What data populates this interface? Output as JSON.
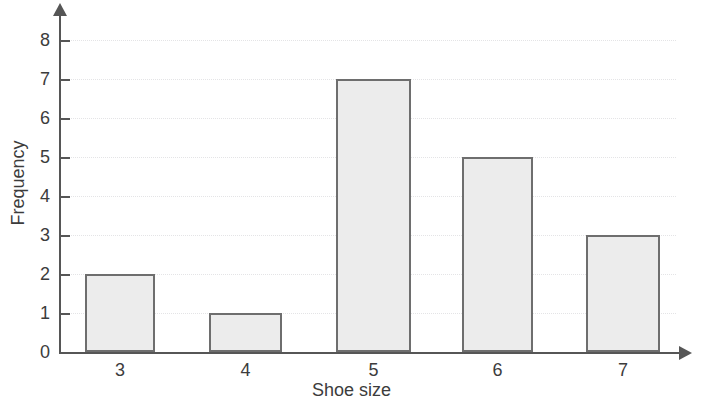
{
  "chart_data": {
    "type": "bar",
    "title": "",
    "xlabel": "Shoe size",
    "ylabel": "Frequency",
    "categories": [
      "3",
      "4",
      "5",
      "6",
      "7"
    ],
    "values": [
      2,
      1,
      7,
      5,
      3
    ],
    "ylim": [
      0,
      8
    ],
    "y_ticks": [
      "0",
      "1",
      "2",
      "3",
      "4",
      "5",
      "6",
      "7",
      "8"
    ],
    "grid": true,
    "legend": "none",
    "bar_fill_color": "#ececec",
    "bar_border_color": "#6e6e6e",
    "axis_color": "#565656",
    "gridline_color": "#e4e4e6",
    "background_color": "#ffffff"
  }
}
